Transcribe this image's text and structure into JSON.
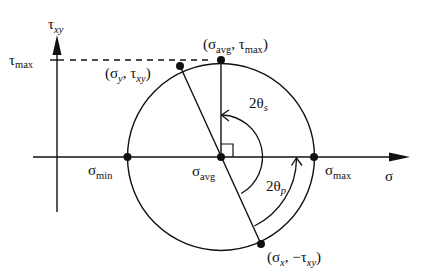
{
  "diagram": {
    "type": "mohr-circle",
    "colors": {
      "stroke": "#111111",
      "background": "#ffffff"
    },
    "axes": {
      "horizontal": {
        "symbol": "σ",
        "sub": ""
      },
      "vertical": {
        "symbol": "τ",
        "sub": "xy"
      }
    },
    "tick_labels": {
      "tau_max": {
        "symbol": "τ",
        "sub": "max"
      },
      "sigma_min": {
        "symbol": "σ",
        "sub": "min"
      },
      "sigma_avg": {
        "symbol": "σ",
        "sub": "avg"
      },
      "sigma_max": {
        "symbol": "σ",
        "sub": "max"
      }
    },
    "points": {
      "top": {
        "open": "(σ",
        "sub1": "avg",
        "mid": ", τ",
        "sub2": "max",
        "close": ")"
      },
      "sy_txy": {
        "open": "(σ",
        "sub1": "y",
        "mid": ", τ",
        "sub2": "xy",
        "close": ")"
      },
      "sx_ntxy": {
        "open": "(σ",
        "sub1": "x",
        "mid": ", −τ",
        "sub2": "xy",
        "close": ")"
      }
    },
    "angles": {
      "shear": {
        "prefix": "2θ",
        "sub": "s"
      },
      "principal": {
        "prefix": "2θ",
        "sub": "p"
      }
    }
  }
}
